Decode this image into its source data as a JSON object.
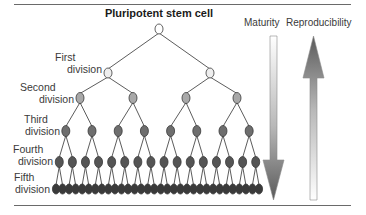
{
  "title": "Pluripotent stem cell",
  "levels": [
    {
      "label_line1": "First",
      "label_line2": "division",
      "color": "#eeeeee"
    },
    {
      "label_line1": "Second",
      "label_line2": "division",
      "color": "#a8a8a8"
    },
    {
      "label_line1": "Third",
      "label_line2": "division",
      "color": "#6e6e6e"
    },
    {
      "label_line1": "Fourth",
      "label_line2": "division",
      "color": "#555555"
    },
    {
      "label_line1": "Fifth",
      "label_line2": "division",
      "color": "#3a3a3a"
    }
  ],
  "root_color": "#ffffff",
  "arrows": {
    "maturity": {
      "label": "Maturity",
      "direction": "down"
    },
    "reproducibility": {
      "label": "Reproducibility",
      "direction": "up"
    }
  }
}
